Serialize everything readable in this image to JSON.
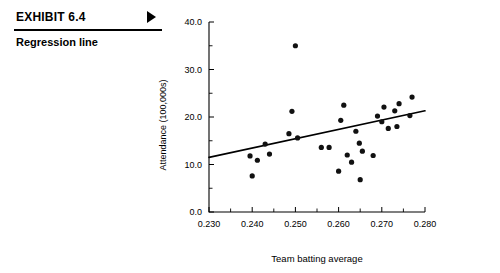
{
  "exhibit": {
    "label": "EXHIBIT 6.4",
    "arrow_icon": "triangle-right-icon",
    "subtitle": "Regression line"
  },
  "chart_data": {
    "type": "scatter",
    "title": "",
    "xlabel": "Team batting average",
    "ylabel": "Attendance (100,000s)",
    "xlim": [
      0.23,
      0.28
    ],
    "ylim": [
      0.0,
      40.0
    ],
    "xticks": [
      0.23,
      0.24,
      0.25,
      0.26,
      0.27,
      0.28
    ],
    "xticklabels": [
      "0.230",
      "0.240",
      "0.250",
      "0.260",
      "0.270",
      "0.280"
    ],
    "xminorticks": [
      0.235,
      0.245,
      0.255,
      0.265,
      0.275
    ],
    "yticks": [
      0.0,
      10.0,
      20.0,
      30.0,
      40.0
    ],
    "yticklabels": [
      "0.0",
      "10.0",
      "20.0",
      "30.0",
      "40.0"
    ],
    "yminorticks": [
      5.0,
      15.0,
      25.0,
      35.0
    ],
    "grid": false,
    "legend": false,
    "points": [
      {
        "x": 0.2395,
        "y": 11.8
      },
      {
        "x": 0.24,
        "y": 7.6
      },
      {
        "x": 0.2412,
        "y": 10.9
      },
      {
        "x": 0.243,
        "y": 14.3
      },
      {
        "x": 0.244,
        "y": 12.2
      },
      {
        "x": 0.2485,
        "y": 16.5
      },
      {
        "x": 0.2492,
        "y": 21.2
      },
      {
        "x": 0.25,
        "y": 35.0
      },
      {
        "x": 0.2505,
        "y": 15.6
      },
      {
        "x": 0.256,
        "y": 13.6
      },
      {
        "x": 0.2578,
        "y": 13.6
      },
      {
        "x": 0.26,
        "y": 8.6
      },
      {
        "x": 0.2605,
        "y": 19.3
      },
      {
        "x": 0.2612,
        "y": 22.5
      },
      {
        "x": 0.262,
        "y": 12.0
      },
      {
        "x": 0.263,
        "y": 10.5
      },
      {
        "x": 0.264,
        "y": 17.0
      },
      {
        "x": 0.2648,
        "y": 14.5
      },
      {
        "x": 0.265,
        "y": 6.8
      },
      {
        "x": 0.2655,
        "y": 12.8
      },
      {
        "x": 0.268,
        "y": 11.9
      },
      {
        "x": 0.269,
        "y": 20.2
      },
      {
        "x": 0.27,
        "y": 19.0
      },
      {
        "x": 0.2705,
        "y": 22.1
      },
      {
        "x": 0.2715,
        "y": 17.6
      },
      {
        "x": 0.273,
        "y": 21.3
      },
      {
        "x": 0.2735,
        "y": 18.0
      },
      {
        "x": 0.274,
        "y": 22.8
      },
      {
        "x": 0.2765,
        "y": 20.3
      },
      {
        "x": 0.277,
        "y": 24.2
      }
    ],
    "regression_line": {
      "x0": 0.23,
      "y0": 11.5,
      "x1": 0.28,
      "y1": 21.3
    }
  }
}
